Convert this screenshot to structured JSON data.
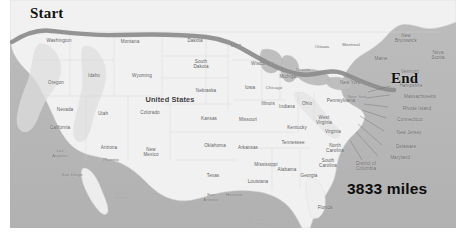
{
  "figure": {
    "kind": "route-map",
    "background": "#ffffff",
    "colors": {
      "ocean": "#b6b6b6",
      "land": "#f2f2f2",
      "land_shade": "#dcdcdc",
      "route": "#8a8a8a",
      "border_line": "#c9c9c9",
      "label_text": "#5b5b5b",
      "annotation_text": "#111111"
    }
  },
  "annotations": {
    "start_label": "Start",
    "end_label": "End",
    "distance_label": "3833 miles"
  },
  "country_label": "United States",
  "map_labels": [
    {
      "text": "Washington",
      "x": 49,
      "y": 41,
      "kind": "state"
    },
    {
      "text": "Oregon",
      "x": 46,
      "y": 83,
      "kind": "state"
    },
    {
      "text": "Idaho",
      "x": 84,
      "y": 76,
      "kind": "state"
    },
    {
      "text": "Montana",
      "x": 120,
      "y": 42,
      "kind": "state"
    },
    {
      "text": "Wyoming",
      "x": 132,
      "y": 76,
      "kind": "state"
    },
    {
      "text": "Nevada",
      "x": 55,
      "y": 110,
      "kind": "state"
    },
    {
      "text": "Utah",
      "x": 93,
      "y": 114,
      "kind": "state"
    },
    {
      "text": "Colorado",
      "x": 140,
      "y": 113,
      "kind": "state"
    },
    {
      "text": "Arizona",
      "x": 99,
      "y": 148,
      "kind": "state"
    },
    {
      "text": "New\nMexico",
      "x": 141,
      "y": 152,
      "kind": "state"
    },
    {
      "text": "California",
      "x": 50,
      "y": 128,
      "kind": "state"
    },
    {
      "text": "Dakota",
      "x": 185,
      "y": 41,
      "kind": "state"
    },
    {
      "text": "South\nDakota",
      "x": 191,
      "y": 64,
      "kind": "state"
    },
    {
      "text": "Nebraska",
      "x": 196,
      "y": 91,
      "kind": "state"
    },
    {
      "text": "Kansas",
      "x": 199,
      "y": 119,
      "kind": "state"
    },
    {
      "text": "Oklahoma",
      "x": 205,
      "y": 146,
      "kind": "state"
    },
    {
      "text": "Texas",
      "x": 203,
      "y": 176,
      "kind": "state"
    },
    {
      "text": "Minn",
      "x": 226,
      "y": 46,
      "kind": "state"
    },
    {
      "text": "Wisconsin",
      "x": 252,
      "y": 64,
      "kind": "state"
    },
    {
      "text": "Iowa",
      "x": 240,
      "y": 88,
      "kind": "state"
    },
    {
      "text": "Missouri",
      "x": 238,
      "y": 120,
      "kind": "state"
    },
    {
      "text": "Arkansas",
      "x": 238,
      "y": 148,
      "kind": "state"
    },
    {
      "text": "Mississippi",
      "x": 256,
      "y": 165,
      "kind": "state"
    },
    {
      "text": "Louisiana",
      "x": 248,
      "y": 182,
      "kind": "state"
    },
    {
      "text": "Illinois",
      "x": 258,
      "y": 104,
      "kind": "state"
    },
    {
      "text": "Indiana",
      "x": 277,
      "y": 107,
      "kind": "state"
    },
    {
      "text": "Michigan",
      "x": 279,
      "y": 77,
      "kind": "state"
    },
    {
      "text": "Ohio",
      "x": 297,
      "y": 104,
      "kind": "state"
    },
    {
      "text": "Kentucky",
      "x": 287,
      "y": 128,
      "kind": "state"
    },
    {
      "text": "Tennessee",
      "x": 283,
      "y": 143,
      "kind": "state"
    },
    {
      "text": "Alabama",
      "x": 277,
      "y": 170,
      "kind": "state"
    },
    {
      "text": "Georgia",
      "x": 299,
      "y": 176,
      "kind": "state"
    },
    {
      "text": "Florida",
      "x": 315,
      "y": 208,
      "kind": "state"
    },
    {
      "text": "West\nVirginia",
      "x": 314,
      "y": 120,
      "kind": "state"
    },
    {
      "text": "Virginia",
      "x": 323,
      "y": 132,
      "kind": "state"
    },
    {
      "text": "North\nCarolina",
      "x": 325,
      "y": 148,
      "kind": "state"
    },
    {
      "text": "South\nCarolina",
      "x": 318,
      "y": 163,
      "kind": "state"
    },
    {
      "text": "Pennsylvania",
      "x": 331,
      "y": 101,
      "kind": "state"
    },
    {
      "text": "New York",
      "x": 340,
      "y": 83,
      "kind": "state"
    },
    {
      "text": "Chicago",
      "x": 264,
      "y": 88,
      "kind": "city"
    },
    {
      "text": "Los\nAngeles",
      "x": 50,
      "y": 154,
      "kind": "city"
    },
    {
      "text": "San Diego",
      "x": 62,
      "y": 175,
      "kind": "city"
    },
    {
      "text": "Phoenix",
      "x": 101,
      "y": 160,
      "kind": "city"
    },
    {
      "text": "San\nAntonio",
      "x": 201,
      "y": 198,
      "kind": "city"
    },
    {
      "text": "Houston",
      "x": 224,
      "y": 195,
      "kind": "city"
    },
    {
      "text": "New York",
      "x": 347,
      "y": 97,
      "kind": "city"
    },
    {
      "text": "Ottawa",
      "x": 312,
      "y": 47,
      "kind": "city"
    },
    {
      "text": "Montreal",
      "x": 341,
      "y": 45,
      "kind": "city"
    },
    {
      "text": "Toronto",
      "x": 293,
      "y": 70,
      "kind": "city"
    },
    {
      "text": "Maine",
      "x": 371,
      "y": 59,
      "kind": "state"
    },
    {
      "text": "New\nBrunswick",
      "x": 396,
      "y": 38,
      "kind": "state"
    },
    {
      "text": "Nova\nScotia",
      "x": 428,
      "y": 55,
      "kind": "state"
    },
    {
      "text": "Vermont",
      "x": 400,
      "y": 72,
      "kind": "state"
    },
    {
      "text": "New\nHampshire",
      "x": 401,
      "y": 83,
      "kind": "state"
    },
    {
      "text": "Massachusetts",
      "x": 410,
      "y": 97,
      "kind": "state"
    },
    {
      "text": "Rhode Island",
      "x": 407,
      "y": 109,
      "kind": "state"
    },
    {
      "text": "Connecticut",
      "x": 400,
      "y": 120,
      "kind": "state"
    },
    {
      "text": "New Jersey",
      "x": 399,
      "y": 133,
      "kind": "state"
    },
    {
      "text": "Delaware",
      "x": 396,
      "y": 147,
      "kind": "state"
    },
    {
      "text": "Maryland",
      "x": 390,
      "y": 158,
      "kind": "state"
    },
    {
      "text": "District of\nColumbia",
      "x": 356,
      "y": 166,
      "kind": "state"
    },
    {
      "text": "Gulf of\nCalifornia",
      "x": 110,
      "y": 196,
      "kind": "water"
    },
    {
      "text": "Gulf of\nMexico",
      "x": 252,
      "y": 222,
      "kind": "water"
    }
  ],
  "route": {
    "name": "driving-route",
    "stroke": "#8a8a8a",
    "path": "M 12,42 C 26,33 38,29 52,31 C 70,33 92,36 118,35 C 150,34 180,34 206,37 C 224,39 236,45 248,52 C 262,60 272,66 284,70 C 296,74 304,76 314,74 C 326,72 334,70 342,73 C 352,77 362,82 374,86 C 382,89 388,90 394,90"
  }
}
